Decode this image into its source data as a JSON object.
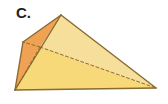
{
  "figure": {
    "label": "C.",
    "kind": "triangular-pyramid-tetrahedron",
    "background_color": "#FFFFFF",
    "colors": {
      "front_face_fill": "#F8D97A",
      "top_face_fill": "#F6DE9B",
      "side_face_fill": "#F0A254",
      "edge_stroke": "#8A6A2F",
      "hidden_edge_stroke": "#8A6A2F",
      "label_color": "#231F20"
    },
    "vertices": {
      "apex": {
        "x": 61,
        "y": 15
      },
      "back_left": {
        "x": 23,
        "y": 42
      },
      "bottom_left": {
        "x": 15,
        "y": 90
      },
      "right": {
        "x": 156,
        "y": 88
      },
      "hidden_back": {
        "x": 40,
        "y": 47
      }
    },
    "faces": [
      {
        "name": "top-face",
        "fill": "#F6DE9B",
        "points": "61,15 23,42 40,47 156,88"
      },
      {
        "name": "front-face",
        "fill": "#F8D97A",
        "points": "15,90 40,47 156,88"
      },
      {
        "name": "left-side-face",
        "fill": "#F0A254",
        "points": "61,15 23,42 15,90 40,47"
      }
    ],
    "solid_edges": [
      {
        "name": "apex-to-back-left",
        "x1": 61,
        "y1": 15,
        "x2": 23,
        "y2": 42
      },
      {
        "name": "apex-to-right",
        "x1": 61,
        "y1": 15,
        "x2": 156,
        "y2": 88
      },
      {
        "name": "apex-to-bottom-left",
        "x1": 61,
        "y1": 15,
        "x2": 15,
        "y2": 90
      },
      {
        "name": "back-left-to-bottom-left",
        "x1": 23,
        "y1": 42,
        "x2": 15,
        "y2": 90
      },
      {
        "name": "bottom-left-to-right",
        "x1": 15,
        "y1": 90,
        "x2": 156,
        "y2": 88
      }
    ],
    "hidden_edges": [
      {
        "name": "hidden-back-to-right",
        "x1": 40,
        "y1": 47,
        "x2": 156,
        "y2": 88
      },
      {
        "name": "hidden-back-to-back-left",
        "x1": 40,
        "y1": 47,
        "x2": 23,
        "y2": 42
      },
      {
        "name": "hidden-back-to-bottom-left",
        "x1": 40,
        "y1": 47,
        "x2": 15,
        "y2": 90
      }
    ]
  }
}
